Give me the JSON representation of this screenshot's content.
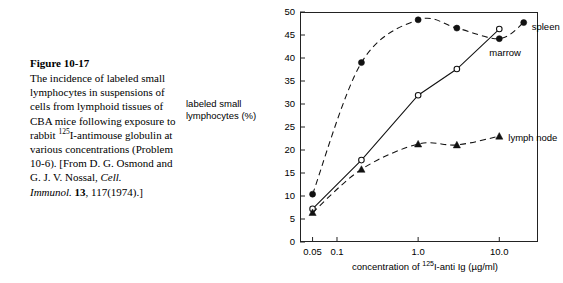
{
  "caption": {
    "title": "Figure 10-17",
    "line1": "The incidence of labeled small",
    "line2": "lymphocytes in suspensions of",
    "line3": "cells from lymphoid tissues of",
    "line4": "CBA mice following exposure",
    "line5_pre": "to rabbit ",
    "line5_sup": "125",
    "line5_post": "I-antimouse",
    "line6": "globulin at various",
    "line7": "concentrations (Problem 10-6).",
    "line8": "[From D. G. Osmond and G. J.",
    "line9_pre": "V. Nossal, ",
    "line9_ital": "Cell. Immunol.",
    "line9_bold": "13",
    "line9_post": ",",
    "line10": "117(1974).]"
  },
  "chart_data": {
    "type": "line",
    "title": "",
    "xlabel_pre": "concentration of ",
    "xlabel_sup": "125",
    "xlabel_post": "I-anti Ig (µg/ml)",
    "ylabel": "labeled small lymphocytes (%)",
    "x_scale": "log",
    "xlim": [
      0.035,
      30
    ],
    "ylim": [
      0,
      50
    ],
    "ytick_labels": [
      "0",
      "5",
      "10",
      "15",
      "20",
      "25",
      "30",
      "35",
      "40",
      "45",
      "50"
    ],
    "ytick_values": [
      0,
      5,
      10,
      15,
      20,
      25,
      30,
      35,
      40,
      45,
      50
    ],
    "xtick_labels": [
      "0.05",
      "0.1",
      "1.0",
      "10.0"
    ],
    "xtick_values": [
      0.05,
      0.1,
      1.0,
      10.0
    ],
    "grid": false,
    "legend_position": "inline-right",
    "series": [
      {
        "name": "spleen",
        "marker": "filled-circle",
        "line": "dashed",
        "x": [
          0.05,
          0.2,
          1.0,
          3.0,
          10.0,
          20.0
        ],
        "values": [
          10.4,
          39.0,
          48.3,
          46.5,
          44.2,
          47.7
        ]
      },
      {
        "name": "marrow",
        "marker": "open-circle",
        "line": "solid",
        "x": [
          0.05,
          0.2,
          1.0,
          3.0,
          10.0
        ],
        "values": [
          7.2,
          17.8,
          31.9,
          37.6,
          46.3
        ]
      },
      {
        "name": "lymph node",
        "marker": "filled-triangle",
        "line": "dashed",
        "x": [
          0.05,
          0.2,
          1.0,
          3.0,
          10.0
        ],
        "values": [
          6.4,
          15.8,
          21.3,
          21.1,
          23.0
        ]
      }
    ],
    "annotations": [
      {
        "text": "spleen",
        "x": 20.0,
        "y": 46.5
      },
      {
        "text": "marrow",
        "x": 10.0,
        "y": 41.0
      },
      {
        "text": "lymph node",
        "x": 10.0,
        "y": 22.5
      }
    ]
  }
}
